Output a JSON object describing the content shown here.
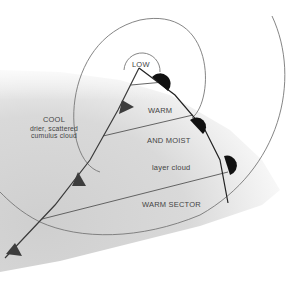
{
  "diagram": {
    "labels": {
      "low": "LOW",
      "cool_title": "COOL",
      "cool_line1": "drier, scattered",
      "cool_line2": "cumulus cloud",
      "warm": "WARM",
      "and_moist": "AND MOIST",
      "layer_cloud": "layer cloud",
      "warm_sector": "WARM SECTOR"
    },
    "colors": {
      "background": "#ffffff",
      "shade": "#d6d6d6",
      "isobar": "#6e6e6e",
      "front": "#3a3a3a",
      "cold_front_symbol": "#3d3d3d",
      "warm_front_symbol": "#111111",
      "text": "#444444"
    },
    "fronts": {
      "cold_front_triangles": 3,
      "warm_front_semicircles": 4
    }
  }
}
